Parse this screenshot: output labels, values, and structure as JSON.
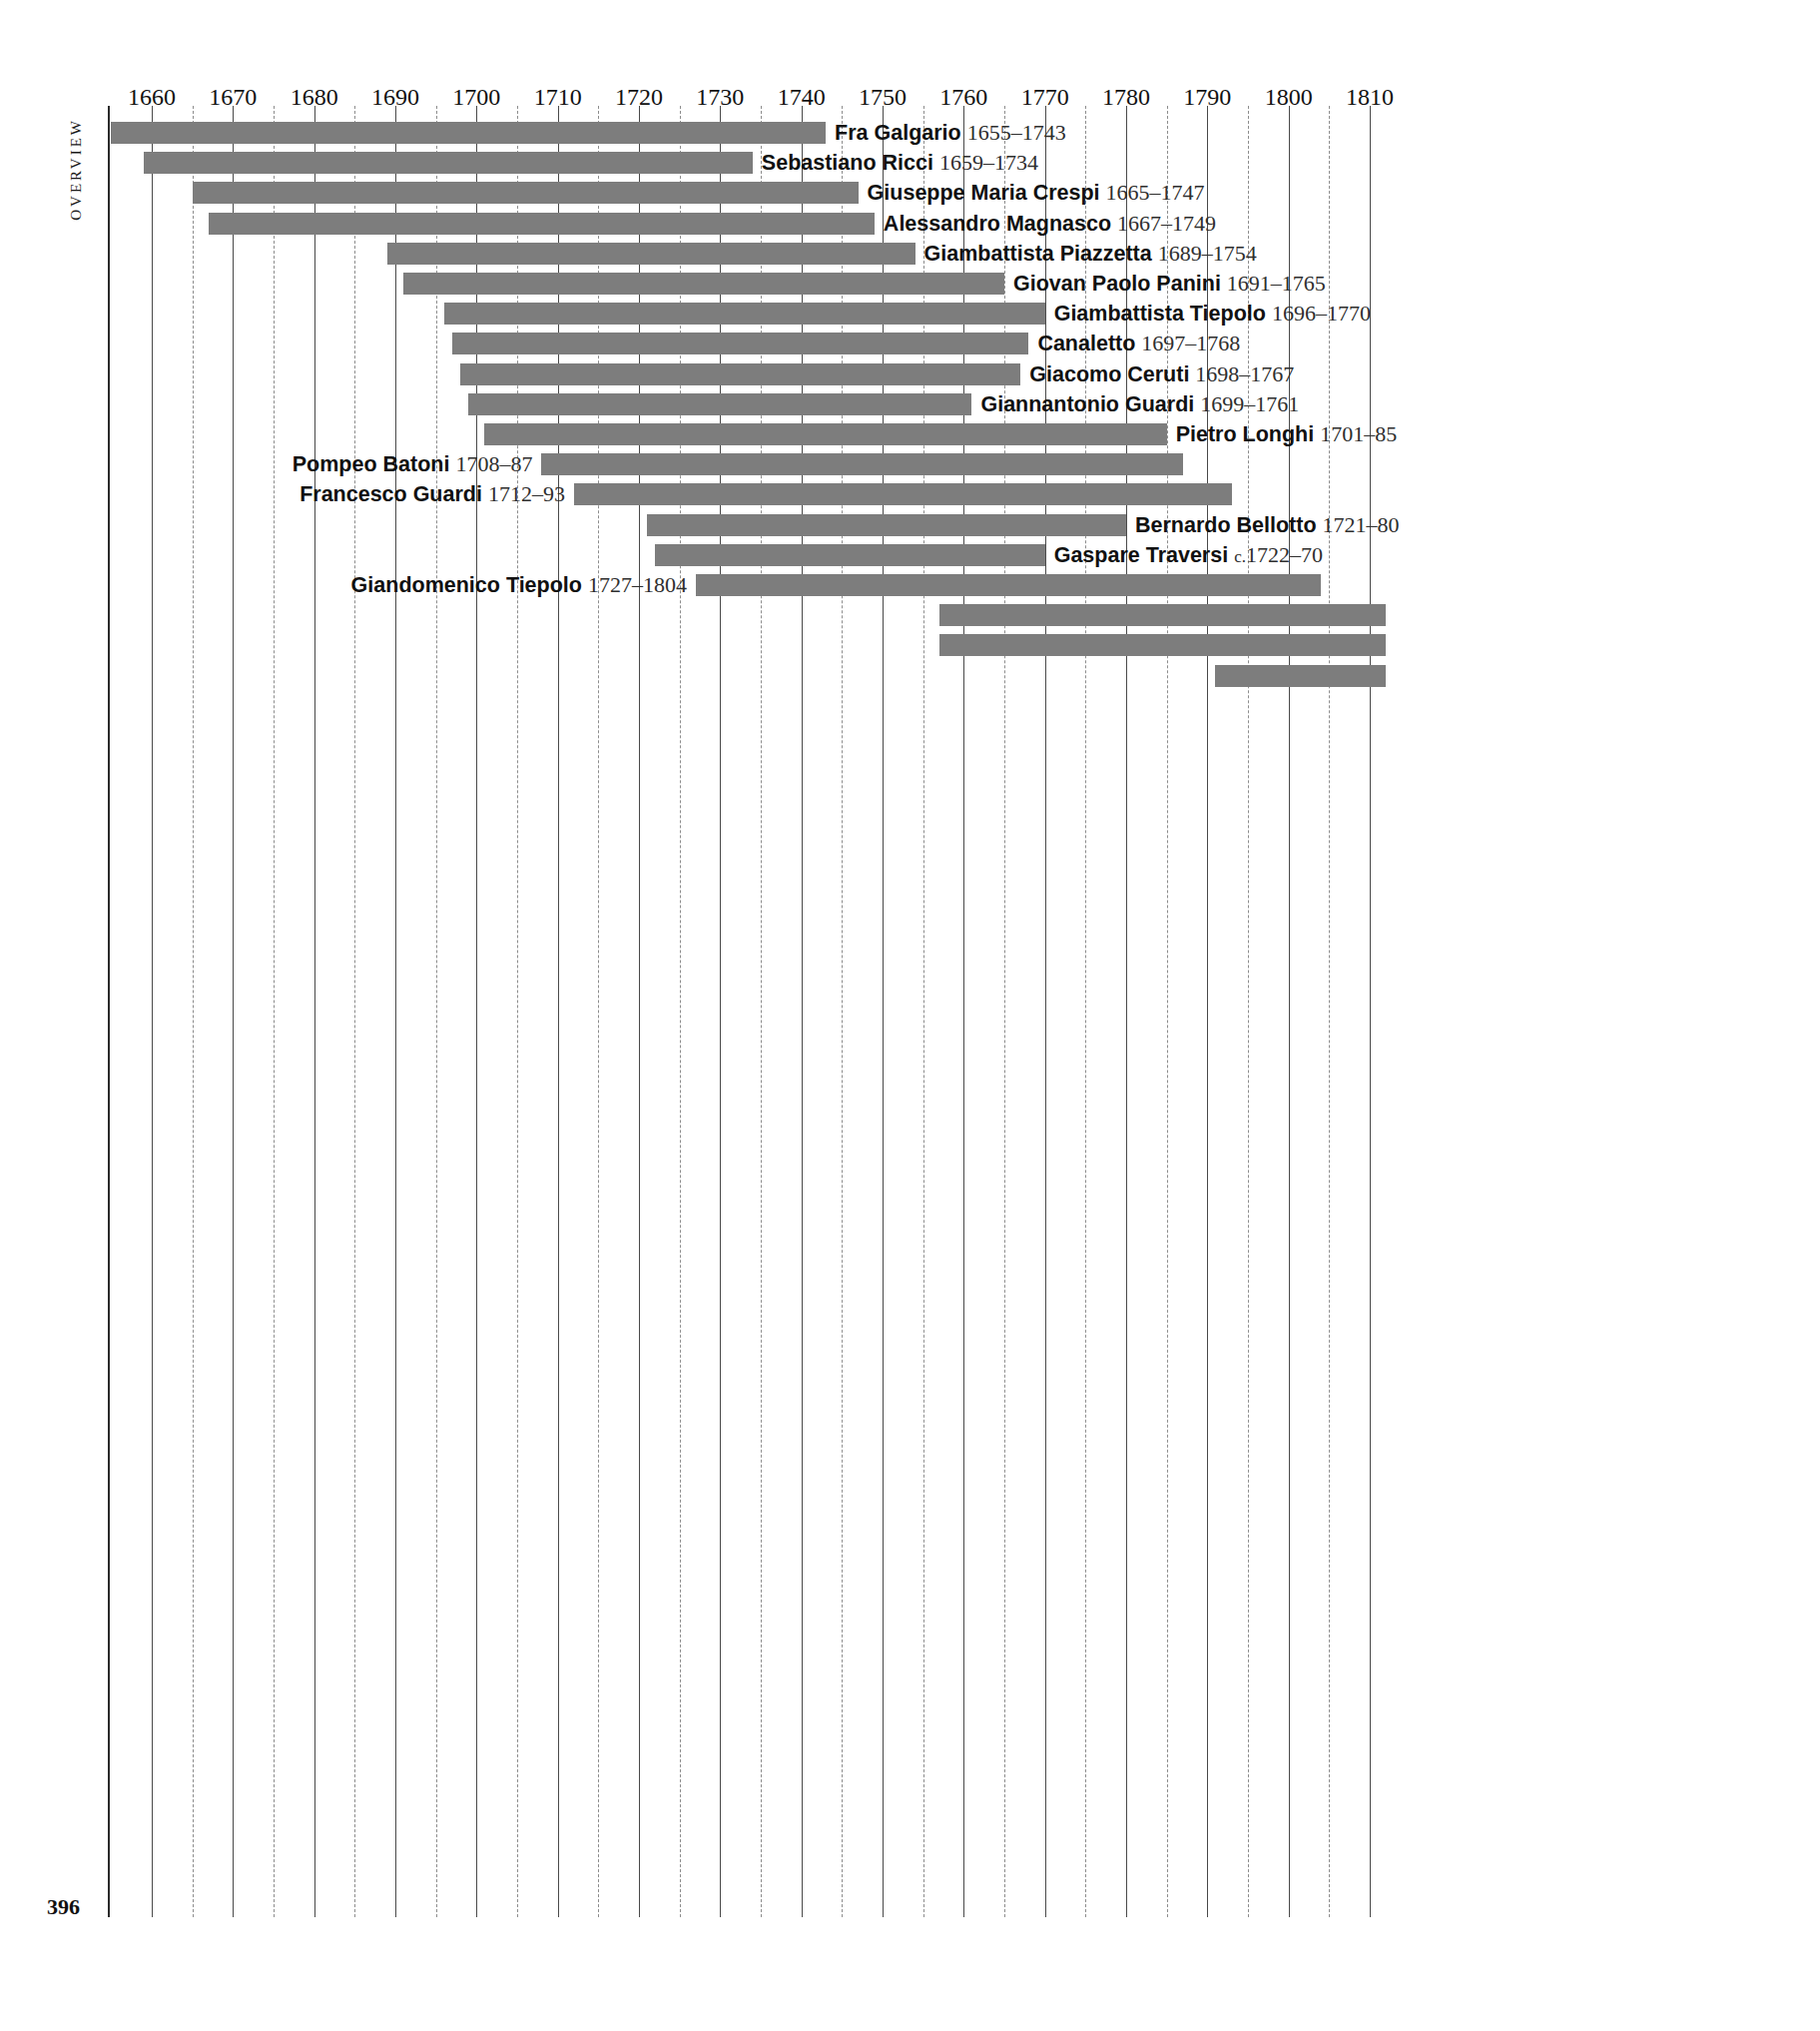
{
  "page": {
    "number": "396",
    "side_label": "OVERVIEW",
    "background": "#ffffff",
    "bar_color": "#7d7d7d",
    "text_color": "#111111"
  },
  "chart_data": {
    "type": "bar",
    "orientation": "horizontal",
    "subtype": "timeline-lifespan-gantt",
    "title": "",
    "xlabel": "",
    "ylabel": "",
    "xlim": [
      1653,
      1812
    ],
    "grid": true,
    "grid_major_step": 10,
    "grid_minor_step": 5,
    "legend": "none",
    "axis_ticks": [
      "1660",
      "1670",
      "1680",
      "1690",
      "1700",
      "1710",
      "1720",
      "1730",
      "1740",
      "1750",
      "1760",
      "1770",
      "1780",
      "1790",
      "1800",
      "1810"
    ],
    "axis_tick_values": [
      1660,
      1670,
      1680,
      1690,
      1700,
      1710,
      1720,
      1730,
      1740,
      1750,
      1760,
      1770,
      1780,
      1790,
      1800,
      1810
    ],
    "categories": [
      "Fra Galgario",
      "Sebastiano Ricci",
      "Giuseppe Maria Crespi",
      "Alessandro Magnasco",
      "Giambattista Piazzetta",
      "Giovan Paolo Panini",
      "Giambattista Tiepolo",
      "Canaletto",
      "Giacomo Ceruti",
      "Giannantonio Guardi",
      "Pietro Longhi",
      "Pompeo Batoni",
      "Francesco Guardi",
      "Bernardo Bellotto",
      "Gaspare Traversi",
      "Giandomenico Tiepolo",
      "",
      "",
      ""
    ],
    "rows": [
      {
        "name": "Fra Galgario",
        "dates": "1655–1743",
        "birth": 1655,
        "death": 1743,
        "label_side": "right"
      },
      {
        "name": "Sebastiano Ricci",
        "dates": "1659–1734",
        "birth": 1659,
        "death": 1734,
        "label_side": "right"
      },
      {
        "name": "Giuseppe Maria Crespi",
        "dates": "1665–1747",
        "birth": 1665,
        "death": 1747,
        "label_side": "right"
      },
      {
        "name": "Alessandro Magnasco",
        "dates": "1667–1749",
        "birth": 1667,
        "death": 1749,
        "label_side": "right"
      },
      {
        "name": "Giambattista Piazzetta",
        "dates": "1689–1754",
        "birth": 1689,
        "death": 1754,
        "label_side": "right"
      },
      {
        "name": "Giovan Paolo Panini",
        "dates": "1691–1765",
        "birth": 1691,
        "death": 1765,
        "label_side": "right"
      },
      {
        "name": "Giambattista Tiepolo",
        "dates": "1696–1770",
        "birth": 1696,
        "death": 1770,
        "label_side": "right"
      },
      {
        "name": "Canaletto",
        "dates": "1697–1768",
        "birth": 1697,
        "death": 1768,
        "label_side": "right"
      },
      {
        "name": "Giacomo Ceruti",
        "dates": "1698–1767",
        "birth": 1698,
        "death": 1767,
        "label_side": "right"
      },
      {
        "name": "Giannantonio Guardi",
        "dates": "1699–1761",
        "birth": 1699,
        "death": 1761,
        "label_side": "right"
      },
      {
        "name": "Pietro Longhi",
        "dates": "1701–85",
        "birth": 1701,
        "death": 1785,
        "label_side": "right"
      },
      {
        "name": "Pompeo Batoni",
        "dates": "1708–87",
        "birth": 1708,
        "death": 1787,
        "label_side": "left"
      },
      {
        "name": "Francesco Guardi",
        "dates": "1712–93",
        "birth": 1712,
        "death": 1793,
        "label_side": "left"
      },
      {
        "name": "Bernardo Bellotto",
        "dates": "1721–80",
        "birth": 1721,
        "death": 1780,
        "label_side": "right"
      },
      {
        "name": "Gaspare Traversi",
        "dates": "c.1722–70",
        "birth": 1722,
        "death": 1770,
        "label_side": "right"
      },
      {
        "name": "Giandomenico Tiepolo",
        "dates": "1727–1804",
        "birth": 1727,
        "death": 1804,
        "label_side": "left"
      },
      {
        "name": "",
        "dates": "",
        "birth": 1757,
        "death": 1812,
        "label_side": "none"
      },
      {
        "name": "",
        "dates": "",
        "birth": 1757,
        "death": 1812,
        "label_side": "none"
      },
      {
        "name": "",
        "dates": "",
        "birth": 1791,
        "death": 1812,
        "label_side": "none"
      }
    ]
  }
}
